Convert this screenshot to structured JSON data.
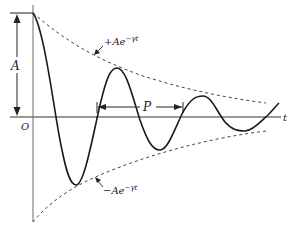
{
  "figure": {
    "type": "damped-oscillation",
    "labels": {
      "amplitude": "A",
      "origin": "O",
      "time_axis": "t",
      "period": "P",
      "upper_envelope_base": "+Ae",
      "upper_envelope_exp": "−γt",
      "lower_envelope_base": "−Ae",
      "lower_envelope_exp": "−γt"
    },
    "colors": {
      "curve": "#1a1a1a",
      "axis": "#555555",
      "envelope": "#444444",
      "background": "#ffffff"
    }
  }
}
